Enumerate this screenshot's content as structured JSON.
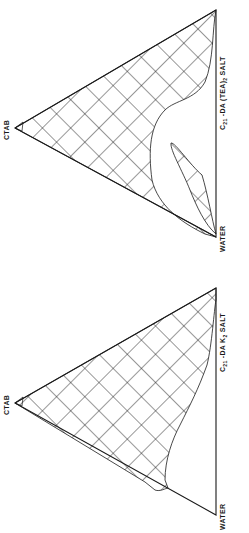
{
  "diagrams": [
    {
      "id": "top",
      "title": "Phase diagram: CTAB / Water / C21-DA (TEA)2 salt",
      "vertices": {
        "top": "CTAB",
        "bottom_left": "WATER",
        "bottom_right": "C21 -DA (TEA)2 SALT"
      },
      "labels": {
        "ctab": "CTAB",
        "water": "WATER",
        "salt_prefix": "C",
        "salt_sub1": "21",
        "salt_mid": " -DA  (TEA)",
        "salt_sub2": "2",
        "salt_suffix": " SALT"
      },
      "regions": [
        "main hatched single-phase region",
        "isolated hatched lens region near water-salt edge"
      ]
    },
    {
      "id": "bottom",
      "title": "Phase diagram: CTAB / Water / C21-DA K2 salt",
      "vertices": {
        "top": "CTAB",
        "bottom_left": "WATER",
        "bottom_right": "C21 -DA K2 SALT"
      },
      "labels": {
        "ctab": "CTAB",
        "water": "WATER",
        "salt_prefix": "C",
        "salt_sub1": "21",
        "salt_mid": " -DA  K",
        "salt_sub2": "2",
        "salt_suffix": " SALT"
      },
      "regions": [
        "main hatched region"
      ]
    }
  ],
  "colors": {
    "line": "#1a1a1a",
    "background": "#ffffff"
  }
}
